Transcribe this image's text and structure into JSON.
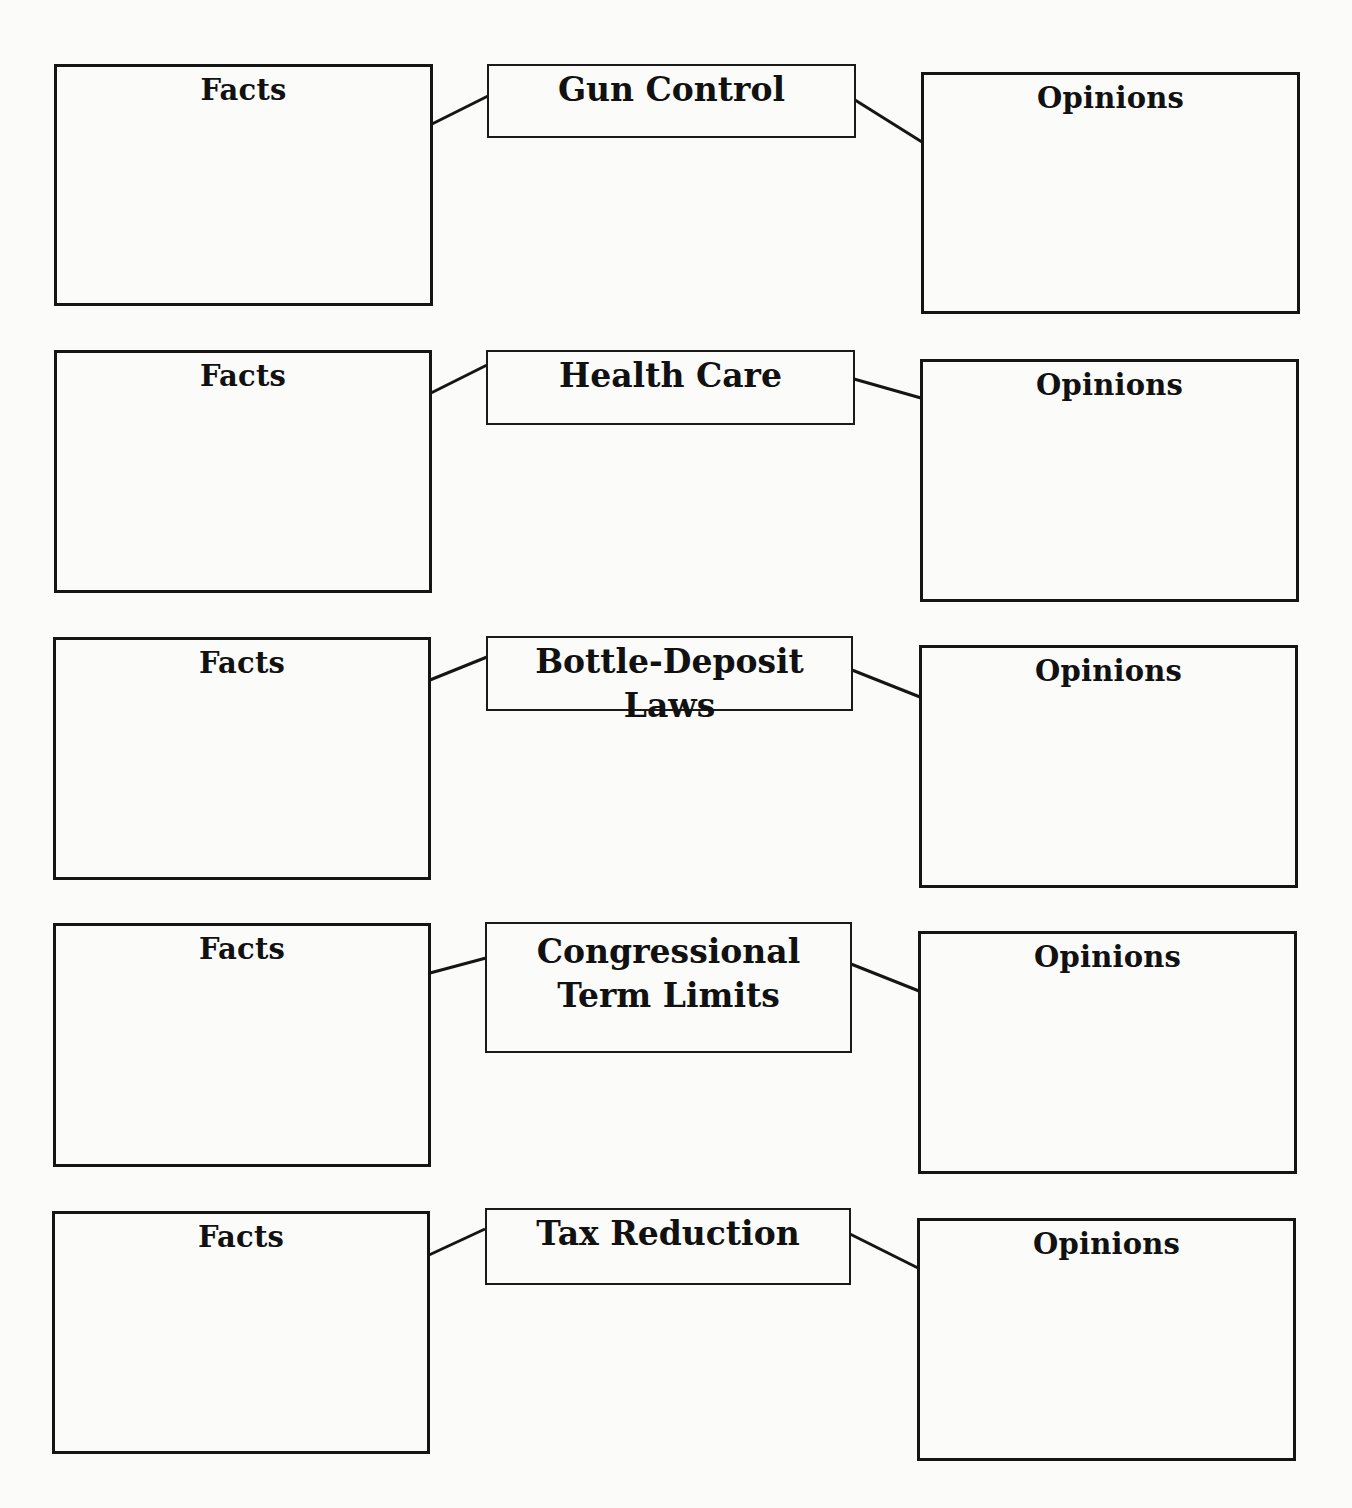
{
  "worksheet": {
    "rows": [
      {
        "topic": "Gun Control",
        "facts_label": "Facts",
        "opinions_label": "Opinions"
      },
      {
        "topic": "Health Care",
        "facts_label": "Facts",
        "opinions_label": "Opinions"
      },
      {
        "topic": "Bottle-Deposit Laws",
        "facts_label": "Facts",
        "opinions_label": "Opinions"
      },
      {
        "topic_line1": "Congressional",
        "topic_line2": "Term Limits",
        "topic": "Congressional Term Limits",
        "facts_label": "Facts",
        "opinions_label": "Opinions"
      },
      {
        "topic": "Tax Reduction",
        "facts_label": "Facts",
        "opinions_label": "Opinions"
      }
    ]
  }
}
